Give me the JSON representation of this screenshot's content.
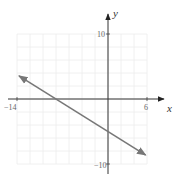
{
  "chart_data": {
    "type": "line",
    "title": "",
    "xlabel": "x",
    "ylabel": "y",
    "xlim": [
      -14,
      6
    ],
    "ylim": [
      -10,
      10
    ],
    "grid": true,
    "grid_step": 2,
    "x_tick_labels": [
      "-14",
      "6"
    ],
    "y_tick_labels": [
      "10",
      "-10"
    ],
    "series": [
      {
        "name": "line",
        "equation": "y = -5/8 x - 5",
        "slope": -0.625,
        "intercept": -5,
        "x_intercept": -8,
        "points": [
          {
            "x": -13.7,
            "y": 3.56
          },
          {
            "x": -8,
            "y": 0
          },
          {
            "x": 0,
            "y": -5
          },
          {
            "x": 5.8,
            "y": -8.63
          }
        ],
        "arrows_both_ends": true,
        "color": "#777777"
      }
    ]
  },
  "labels": {
    "x_axis": "x",
    "y_axis": "y",
    "x_min": "−14",
    "x_max": "6",
    "y_max": "10",
    "y_min": "−10"
  },
  "colors": {
    "axis": "#333333",
    "grid": "#ececec",
    "line": "#777777",
    "text": "#666666"
  }
}
